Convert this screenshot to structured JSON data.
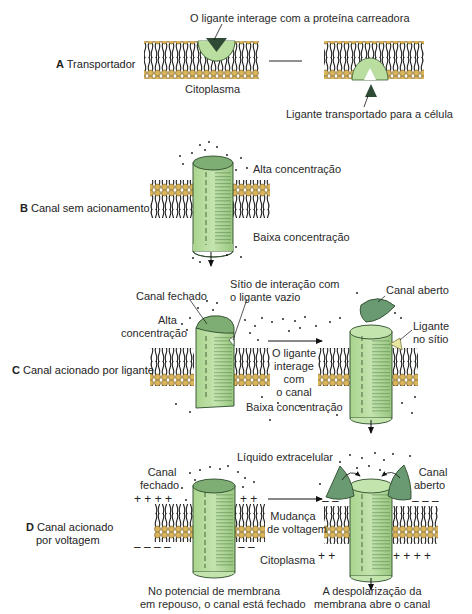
{
  "colors": {
    "protein_light": "#b9dea0",
    "protein_dark": "#6a9a72",
    "lipid_head": "#d9b45a",
    "lipid_tail": "#222222",
    "ligand": "#2f4a35",
    "ligand_bound": "#e8e6a0"
  },
  "panels": [
    {
      "letter": "A",
      "title": "Transportador",
      "labels": {
        "top": "O ligante interage com a proteína carreadora",
        "cytoplasm": "Citoplasma",
        "bottom_right": "Ligante transportado para a célula"
      }
    },
    {
      "letter": "B",
      "title": "Canal sem acionamento",
      "labels": {
        "high": "Alta concentração",
        "low": "Baixa concentração"
      }
    },
    {
      "letter": "C",
      "title": "Canal acionado por ligante",
      "labels": {
        "closed": "Canal fechado",
        "site_l1": "Sítio de interação com",
        "site_l2": "o ligante vazio",
        "high_l1": "Alta",
        "high_l2": "concentração",
        "interact_l1": "O ligante",
        "interact_l2": "interage",
        "interact_l3": "com",
        "interact_l4": "o canal",
        "low": "Baixa concentração",
        "open": "Canal aberto",
        "bound_l1": "Ligante",
        "bound_l2": "no sítio"
      }
    },
    {
      "letter": "D",
      "title_l1": "Canal acionado",
      "title_l2": "por voltagem",
      "labels": {
        "extracellular": "Líquido extracelular",
        "closed_l1": "Canal",
        "closed_l2": "fechado",
        "open_l1": "Canal",
        "open_l2": "aberto",
        "change_l1": "Mudança",
        "change_l2": "de voltagem",
        "cytoplasm": "Citoplasma",
        "rest_l1": "No potencial de membrana",
        "rest_l2": "em repouso, o canal está fechado",
        "depol_l1": "A despolarização da",
        "depol_l2": "membrana abre o canal"
      }
    }
  ]
}
